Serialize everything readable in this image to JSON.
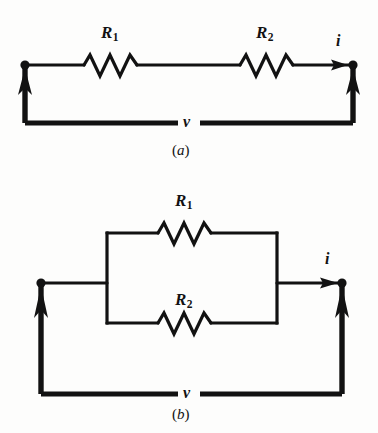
{
  "figure": {
    "kind": "circuit-diagram",
    "background_color": "#fdfdfc",
    "ink_color": "#121212",
    "panels": [
      {
        "id": "a",
        "caption_open": "(",
        "caption_letter": "a",
        "caption_close": ")",
        "caption": "(a)",
        "topology": "series",
        "labels": {
          "r1_symbol": "R",
          "r1_subscript": "1",
          "r2_symbol": "R",
          "r2_subscript": "2",
          "current": "i",
          "voltage": "v"
        }
      },
      {
        "id": "b",
        "caption_open": "(",
        "caption_letter": "b",
        "caption_close": ")",
        "caption": "(b)",
        "topology": "parallel",
        "labels": {
          "r1_symbol": "R",
          "r1_subscript": "1",
          "r2_symbol": "R",
          "r2_subscript": "2",
          "current": "i",
          "voltage": "v"
        }
      }
    ],
    "elements": {
      "resistor_a_r1": "resistor-zigzag",
      "resistor_a_r2": "resistor-zigzag",
      "resistor_b_r1": "resistor-zigzag",
      "resistor_b_r2": "resistor-zigzag",
      "node_a_left": "terminal-node-dot",
      "node_a_right": "terminal-node-dot",
      "node_b_left": "terminal-node-dot",
      "node_b_right": "terminal-node-dot",
      "arrow_a_current": "current-arrow-right",
      "arrow_b_current": "current-arrow-right",
      "arrow_a_left_up": "voltage-arrow-up",
      "arrow_a_right_up": "voltage-arrow-up",
      "arrow_b_left_up": "voltage-arrow-up",
      "arrow_b_right_up": "voltage-arrow-up"
    }
  }
}
